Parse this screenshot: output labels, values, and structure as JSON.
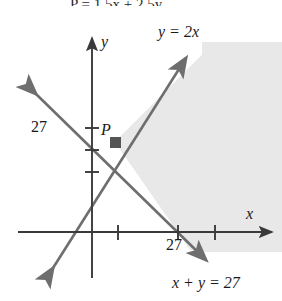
{
  "figure": {
    "title_fragment": "P = 1.5x + 2.5y",
    "width": 282,
    "height": 301,
    "background": "#ffffff"
  },
  "axes": {
    "x_label": "x",
    "y_label": "y",
    "origin_px": [
      65,
      232
    ],
    "x_axis_color": "#3a3a3a",
    "y_axis_color": "#3a3a3a"
  },
  "ticks": {
    "y": [
      {
        "label": "",
        "value": null,
        "y_px": 169
      },
      {
        "label": "",
        "value": null,
        "y_px": 150
      },
      {
        "label": "27",
        "value": 27,
        "y_px": 128
      }
    ],
    "x": [
      {
        "label": "",
        "value": null,
        "x_px": 118
      },
      {
        "label": "27",
        "value": 27,
        "x_px": 178
      },
      {
        "label": "",
        "value": null,
        "x_px": 215
      }
    ]
  },
  "lines": [
    {
      "name": "line-y-equals-2x",
      "label": "y = 2x",
      "equation": "y = 2x",
      "slope": 2,
      "intercept": 0,
      "color": "#6e6e6e",
      "arrow_start": true,
      "arrow_end": true
    },
    {
      "name": "line-x-plus-y-equals-27",
      "label": "x + y = 27",
      "equation": "x + y = 27",
      "slope": -1,
      "intercept": 27,
      "color": "#6e6e6e",
      "arrow_start": true,
      "arrow_end": true
    }
  ],
  "points": [
    {
      "name": "vertex-p",
      "label": "P",
      "marker": "square",
      "color": "#555555",
      "x_px": 115,
      "y_px": 142
    }
  ],
  "shaded_region": {
    "name": "feasible-region",
    "fill": "#e8e8e8",
    "description": "Region to the right of P bounded above by y = 2x and below by x + y = 27"
  },
  "colors": {
    "line": "#6e6e6e",
    "axis": "#3a3a3a",
    "shade": "#e8e8e8",
    "text": "#1a1a1a",
    "marker": "#555555"
  }
}
